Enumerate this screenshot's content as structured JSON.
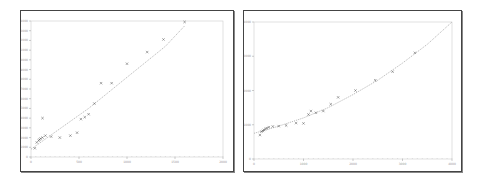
{
  "chart_data": [
    {
      "type": "scatter",
      "title": "",
      "xlabel": "",
      "ylabel": "",
      "x_ticks": [
        "0",
        "500",
        "1000",
        "1500",
        "2000"
      ],
      "y_ticks": [
        "0",
        "1000",
        "2000",
        "3000",
        "4000",
        "5000",
        "6000",
        "7000",
        "8000",
        "9000",
        "10000",
        "11000",
        "12000",
        "13000",
        "14000"
      ],
      "xlim": [
        0,
        2000
      ],
      "ylim": [
        0,
        14000
      ],
      "grid": false,
      "series": [
        {
          "name": "observed",
          "marker": "x",
          "points": [
            [
              40,
              900
            ],
            [
              60,
              1500
            ],
            [
              80,
              1700
            ],
            [
              90,
              1800
            ],
            [
              100,
              1900
            ],
            [
              120,
              2000
            ],
            [
              120,
              4000
            ],
            [
              150,
              2200
            ],
            [
              210,
              2100
            ],
            [
              300,
              2000
            ],
            [
              410,
              2200
            ],
            [
              480,
              2500
            ],
            [
              520,
              3900
            ],
            [
              560,
              4100
            ],
            [
              600,
              4400
            ],
            [
              660,
              5500
            ],
            [
              730,
              7600
            ],
            [
              840,
              7600
            ],
            [
              1000,
              9600
            ],
            [
              1210,
              10800
            ],
            [
              1380,
              12100
            ],
            [
              1600,
              13900
            ]
          ]
        },
        {
          "name": "fit",
          "style": "dotted-line",
          "points": [
            [
              0,
              800
            ],
            [
              200,
              2200
            ],
            [
              400,
              3600
            ],
            [
              600,
              5000
            ],
            [
              800,
              6600
            ],
            [
              1000,
              8200
            ],
            [
              1200,
              9800
            ],
            [
              1400,
              11400
            ],
            [
              1600,
              13500
            ]
          ]
        }
      ]
    },
    {
      "type": "scatter",
      "title": "",
      "xlabel": "",
      "ylabel": "",
      "x_ticks": [
        "0",
        "1000",
        "2000",
        "3000",
        "4000"
      ],
      "y_ticks": [
        "0",
        "1000",
        "2000",
        "3000",
        "4000"
      ],
      "xlim": [
        0,
        4000
      ],
      "ylim": [
        0,
        4000
      ],
      "grid": false,
      "series": [
        {
          "name": "observed",
          "marker": "x",
          "points": [
            [
              120,
              700
            ],
            [
              150,
              800
            ],
            [
              180,
              820
            ],
            [
              200,
              850
            ],
            [
              230,
              880
            ],
            [
              260,
              900
            ],
            [
              300,
              930
            ],
            [
              380,
              950
            ],
            [
              500,
              960
            ],
            [
              650,
              980
            ],
            [
              850,
              1050
            ],
            [
              1000,
              1040
            ],
            [
              1100,
              1300
            ],
            [
              1150,
              1400
            ],
            [
              1250,
              1350
            ],
            [
              1400,
              1400
            ],
            [
              1550,
              1600
            ],
            [
              1700,
              1800
            ],
            [
              2050,
              2000
            ],
            [
              2450,
              2300
            ],
            [
              2800,
              2550
            ],
            [
              3250,
              3100
            ]
          ]
        },
        {
          "name": "fit",
          "style": "dotted-line",
          "points": [
            [
              0,
              750
            ],
            [
              500,
              960
            ],
            [
              1000,
              1200
            ],
            [
              1500,
              1500
            ],
            [
              2000,
              1880
            ],
            [
              2500,
              2300
            ],
            [
              3000,
              2800
            ],
            [
              3500,
              3350
            ],
            [
              4000,
              4000
            ]
          ]
        }
      ]
    }
  ],
  "charts": {
    "left": {
      "frame": {
        "x": 20,
        "y": 10,
        "w": 212,
        "h": 160
      },
      "plot": {
        "x": 30,
        "y": 20,
        "w": 192,
        "h": 136
      },
      "marker_color": "#555555",
      "line_color": "#aaaaaa"
    },
    "right": {
      "frame": {
        "x": 243,
        "y": 10,
        "w": 217,
        "h": 160
      },
      "plot": {
        "x": 253,
        "y": 21,
        "w": 198,
        "h": 137
      },
      "marker_color": "#555555",
      "line_color": "#aaaaaa"
    }
  }
}
